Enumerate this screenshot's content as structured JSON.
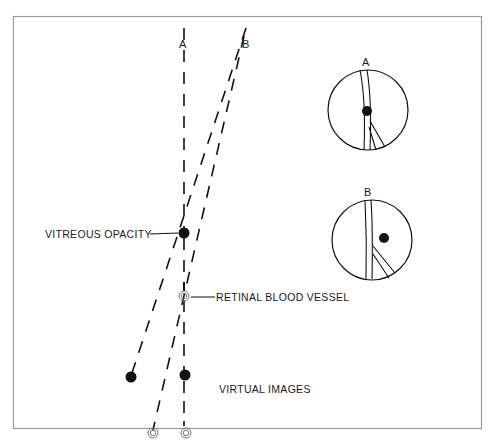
{
  "figure": {
    "frame": {
      "x": 13,
      "y": 16,
      "width": 469,
      "height": 413,
      "stroke": "#9a9a9a"
    },
    "ray_labels": {
      "a": "A",
      "b": "B"
    },
    "annotations": {
      "vitreous_opacity": "VITREOUS OPACITY",
      "retinal_blood_vessel": "RETINAL BLOOD VESSEL",
      "virtual_images": "VIRTUAL IMAGES"
    },
    "insets": [
      {
        "label": "A",
        "cx": 368,
        "cy": 110,
        "r": 39,
        "opacity_position": "on-vessel"
      },
      {
        "label": "B",
        "cx": 372,
        "cy": 240,
        "r": 39,
        "opacity_position": "right-of-vessel"
      }
    ],
    "colors": {
      "ink": "#111111",
      "frame": "#9a9a9a",
      "background": "#ffffff"
    }
  }
}
